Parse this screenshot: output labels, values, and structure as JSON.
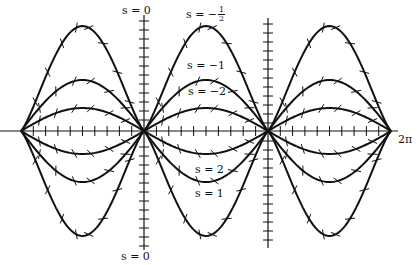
{
  "diagram": {
    "type": "direction-field-with-solution-curves",
    "background": "#ffffff",
    "ink": "#111111",
    "x_axis": {
      "y": 131,
      "x_start": 0,
      "x_end": 398,
      "end_label": "2π"
    },
    "vertical_axes": [
      {
        "x": 144,
        "y_top": 15,
        "y_bottom": 250,
        "top_label": "s = 0",
        "bottom_label": "s = 0"
      },
      {
        "x": 268,
        "y_top": 18,
        "y_bottom": 248
      }
    ],
    "nodes_x": [
      21,
      144,
      268,
      391
    ],
    "amplitudes": {
      "outer": 105,
      "middle": 51,
      "inner": 23
    },
    "curve_labels": [
      {
        "id": "s-neg-half",
        "prefix": "s = −",
        "num": "1",
        "den": "2",
        "x": 186,
        "y": 8
      },
      {
        "id": "s-neg-1",
        "text": "s = −1",
        "x": 187,
        "y": 65
      },
      {
        "id": "s-neg-2",
        "text": "s = −2",
        "x": 188,
        "y": 90
      },
      {
        "id": "s-2",
        "text": "s = 2",
        "x": 195,
        "y": 165
      },
      {
        "id": "s-1",
        "text": "s = 1",
        "x": 195,
        "y": 189
      }
    ]
  }
}
